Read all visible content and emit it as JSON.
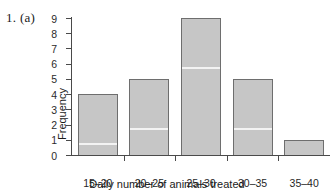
{
  "figure": {
    "problem_label": "1. (a)"
  },
  "chart_data": {
    "type": "bar",
    "title": "",
    "categories": [
      "15–20",
      "20–25",
      "25–30",
      "30–35",
      "35–40"
    ],
    "values": [
      4,
      5,
      9,
      5,
      1
    ],
    "xlabel": "Daily number of animals treated",
    "ylabel": "Frequency",
    "ylim": [
      0,
      9
    ],
    "ytick_labels": [
      "0",
      "1",
      "2",
      "3",
      "4",
      "5",
      "6",
      "7",
      "8",
      "9"
    ],
    "ytick_values": [
      0,
      1,
      2,
      3,
      4,
      5,
      6,
      7,
      8,
      9
    ],
    "grid": false,
    "legend": false,
    "bar_fill_color": "#c6c6c6",
    "bar_border_color": "#6e6e6e",
    "axis_color": "#4a4a4a"
  }
}
